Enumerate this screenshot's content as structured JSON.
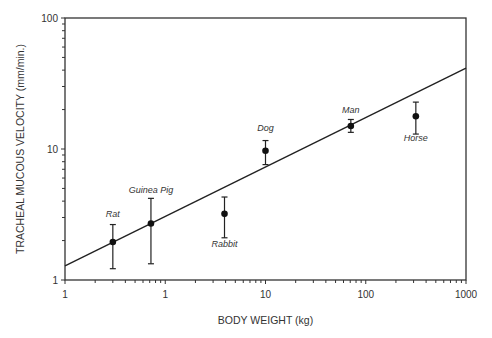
{
  "chart_data": {
    "type": "scatter",
    "title": "",
    "xlabel": "BODY WEIGHT (kg)",
    "ylabel": "TRACHEAL MUCOUS VELOCITY (mm/min.)",
    "xscale": "log",
    "yscale": "log",
    "xlim": [
      0.1,
      1000
    ],
    "ylim": [
      1,
      100
    ],
    "x_tick_labels": [
      "1",
      "1",
      "10",
      "100",
      "1000"
    ],
    "y_tick_labels": [
      "1",
      "10",
      "100"
    ],
    "grid": false,
    "points": [
      {
        "label": "Rat",
        "x": 0.3,
        "y": 1.95,
        "err_low": 1.22,
        "err_high": 2.65
      },
      {
        "label": "Guinea Pig",
        "x": 0.72,
        "y": 2.7,
        "err_low": 1.33,
        "err_high": 4.2
      },
      {
        "label": "Rabbit",
        "x": 3.9,
        "y": 3.2,
        "err_low": 2.1,
        "err_high": 4.3
      },
      {
        "label": "Dog",
        "x": 10,
        "y": 9.7,
        "err_low": 7.6,
        "err_high": 11.6
      },
      {
        "label": "Man",
        "x": 71,
        "y": 15,
        "err_low": 13.4,
        "err_high": 16.8
      },
      {
        "label": "Horse",
        "x": 316,
        "y": 17.8,
        "err_low": 13.0,
        "err_high": 22.8
      }
    ],
    "regression_line": {
      "x": [
        0.1,
        1000
      ],
      "y": [
        1.28,
        41.5
      ]
    }
  }
}
